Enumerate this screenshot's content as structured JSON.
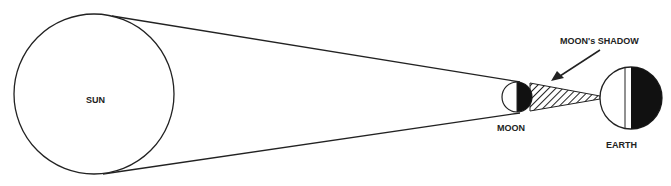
{
  "diagram": {
    "labels": {
      "sun": "SUN",
      "moon": "MOON",
      "earth": "EARTH",
      "shadow": "MOON's SHADOW"
    },
    "bodies": [
      {
        "name": "Sun",
        "cx": 94,
        "cy": 94,
        "r": 80
      },
      {
        "name": "Moon",
        "cx": 517,
        "cy": 97,
        "r": 16
      },
      {
        "name": "Earth",
        "cx": 631,
        "cy": 97,
        "r": 31
      }
    ],
    "colors": {
      "stroke": "#222222",
      "shadow_fill": "#111111",
      "background": "#ffffff"
    }
  }
}
